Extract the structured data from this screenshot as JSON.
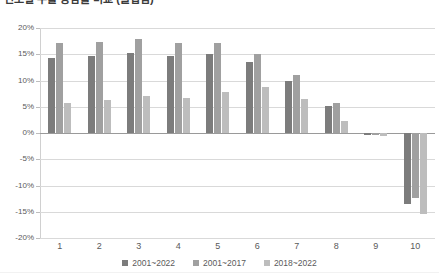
{
  "chart_title": "연도별 수출 증감률 비교 (클립됨)",
  "axis": {
    "y_ticks": [
      "20%",
      "15%",
      "10%",
      "5%",
      "0%",
      "-5%",
      "-10%",
      "-15%",
      "-20%"
    ],
    "y_values": [
      20,
      15,
      10,
      5,
      0,
      -5,
      -10,
      -15,
      -20
    ],
    "x_ticks": [
      "1",
      "2",
      "3",
      "4",
      "5",
      "6",
      "7",
      "8",
      "9",
      "10"
    ]
  },
  "legend": {
    "position": "bottom",
    "items": [
      {
        "label": "2001~2022",
        "color": "#7c7c7c"
      },
      {
        "label": "2001~2017",
        "color": "#a0a0a0"
      },
      {
        "label": "2018~2022",
        "color": "#bdbdbd"
      }
    ]
  },
  "colors": {
    "series_0": "#7c7c7c",
    "series_1": "#a0a0a0",
    "series_2": "#bdbdbd",
    "gridline": "#d9d9d9",
    "zero_line": "#9a9a9a",
    "text": "#5a5a5a"
  },
  "chart_data": {
    "type": "bar",
    "title": "",
    "xlabel": "",
    "ylabel": "",
    "ylim": [
      -20,
      20
    ],
    "ytick_step": 5,
    "grid": true,
    "legend_position": "bottom",
    "categories": [
      "1",
      "2",
      "3",
      "4",
      "5",
      "6",
      "7",
      "8",
      "9",
      "10"
    ],
    "series": [
      {
        "name": "2001~2022",
        "color": "#7c7c7c",
        "values": [
          14.3,
          14.6,
          15.2,
          14.7,
          15.0,
          13.5,
          10.0,
          5.2,
          -0.3,
          -13.5
        ]
      },
      {
        "name": "2001~2017",
        "color": "#a0a0a0",
        "values": [
          17.2,
          17.3,
          17.9,
          17.2,
          17.2,
          15.0,
          11.0,
          5.8,
          -0.3,
          -12.3
        ]
      },
      {
        "name": "2018~2022",
        "color": "#bdbdbd",
        "values": [
          5.8,
          6.2,
          7.0,
          6.6,
          7.8,
          8.8,
          6.5,
          2.3,
          -0.5,
          -15.5
        ]
      }
    ]
  }
}
